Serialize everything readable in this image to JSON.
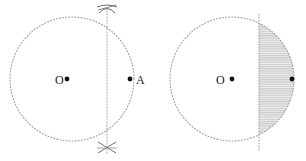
{
  "figure": {
    "background_color": "#ffffff",
    "stroke_color": "#9a9a9a",
    "label_color": "#1a1a1a",
    "shade_color": "#d9d9d9",
    "width": 306,
    "height": 161
  },
  "left_diagram": {
    "name": "circle-with-perpendicular-bisector",
    "circle": {
      "cx": 72,
      "cy": 79,
      "r": 62,
      "style": "dotted"
    },
    "center_label": "O",
    "center_label_x": 55,
    "center_label_y": 84,
    "center_dot": {
      "x": 67,
      "y": 79,
      "r": 2.4
    },
    "point_label": "A",
    "point_label_x": 136,
    "point_label_y": 84,
    "point_dot": {
      "x": 130,
      "y": 79,
      "r": 2.4
    },
    "vertical_line": {
      "x": 107,
      "y1": 8,
      "y2": 155,
      "style": "dotted"
    },
    "arc_marks": [
      {
        "name": "top-arc-intersection",
        "x": 107,
        "y": 9
      },
      {
        "name": "bottom-arc-intersection",
        "x": 107,
        "y": 147
      }
    ]
  },
  "right_diagram": {
    "name": "circle-with-shaded-segment",
    "circle": {
      "cx": 232,
      "cy": 79,
      "r": 62,
      "style": "dotted"
    },
    "center_label": "O",
    "center_label_x": 216,
    "center_label_y": 84,
    "center_dot": {
      "x": 232,
      "y": 79,
      "r": 2.4
    },
    "edge_dot": {
      "x": 292,
      "y": 79,
      "r": 2.4
    },
    "vertical_line": {
      "x": 259,
      "y1": 14,
      "y2": 150,
      "style": "dotted"
    },
    "shaded_segment": {
      "name": "minor-segment-right-of-chord",
      "chord_x": 259,
      "fill": "hatched-horizontal",
      "fill_color": "#dcdcdc"
    }
  }
}
